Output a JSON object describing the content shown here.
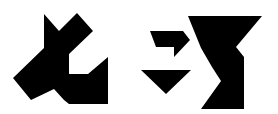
{
  "figure": {
    "kind": "tangram-silhouettes",
    "background": "#ffffff",
    "fill": "#000000",
    "shapes": [
      {
        "name": "figure-1",
        "polygons": [
          "13,78 44,48 44,14 59,31 77,13 93,31 69,54 69,74 88,74 108,57 108,104 69,104 64,100 54,89 31,100"
        ]
      },
      {
        "name": "figure-2",
        "polygons": [
          "150,31 183,31 190,40 174,57 174,47 156,47",
          "141,70 191,70 166,94",
          "188,16 262,16 236,47 244,57 244,109 201,109 221,81 212,67 201,48"
        ]
      }
    ]
  }
}
